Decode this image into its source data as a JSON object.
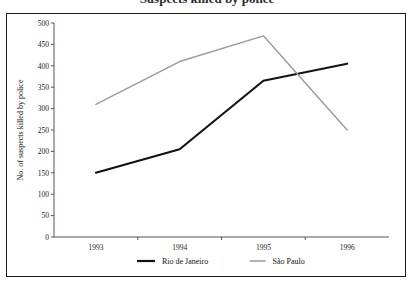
{
  "figure": {
    "title": "Suspects killed by police",
    "frame_color": "#1a1a1a",
    "background": "#ffffff"
  },
  "chart_data": {
    "type": "line",
    "title": "Suspects killed by police",
    "xlabel": "",
    "ylabel": "No. of suspects killed by police",
    "categories": [
      "1993",
      "1994",
      "1995",
      "1996"
    ],
    "ylim": [
      0,
      500
    ],
    "ytick_step": 50,
    "yticks": [
      "0",
      "50",
      "100",
      "150",
      "200",
      "250",
      "300",
      "350",
      "400",
      "450",
      "500"
    ],
    "grid": false,
    "legend_position": "bottom",
    "series": [
      {
        "name": "Rio de Janeiro",
        "color": "#111111",
        "values": [
          150,
          205,
          365,
          405
        ]
      },
      {
        "name": "São Paulo",
        "color": "#9a9a9a",
        "values": [
          310,
          410,
          470,
          250
        ]
      }
    ]
  },
  "legend": {
    "items": [
      {
        "label": "Rio de Janeiro",
        "color": "#111111"
      },
      {
        "label": "São Paulo",
        "color": "#9a9a9a"
      }
    ]
  }
}
